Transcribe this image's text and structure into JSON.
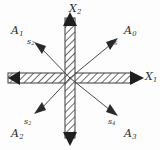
{
  "figure": {
    "background_color": "#fdfdfd",
    "ink_color": "#2b2b2b",
    "center": {
      "x": 70,
      "y": 78
    }
  },
  "axes": [
    {
      "name": "x1-axis",
      "label_base": "X",
      "label_sub": "1",
      "orientation": "horizontal",
      "style": "hatched-band",
      "arrow_ends": [
        "left",
        "right"
      ],
      "label_pos": {
        "x": 145,
        "y": 71
      }
    },
    {
      "name": "x2-axis",
      "label_base": "X",
      "label_sub": "2",
      "orientation": "vertical",
      "style": "hatched-band",
      "arrow_ends": [
        "top",
        "bottom"
      ],
      "label_pos": {
        "x": 69,
        "y": 3
      }
    }
  ],
  "rays": [
    {
      "name": "ray-s6",
      "label_base": "s",
      "label_sub": "6",
      "direction_deg": 45,
      "label_pos": {
        "x": 110,
        "y": 38
      }
    },
    {
      "name": "ray-s2-upper-left",
      "label_base": "s",
      "label_sub": "2",
      "direction_deg": 135,
      "label_pos": {
        "x": 27,
        "y": 38
      }
    },
    {
      "name": "ray-s2-lower-left",
      "label_base": "s",
      "label_sub": "2",
      "direction_deg": 225,
      "label_pos": {
        "x": 24,
        "y": 118
      }
    },
    {
      "name": "ray-s4",
      "label_base": "s",
      "label_sub": "4",
      "direction_deg": 315,
      "label_pos": {
        "x": 108,
        "y": 118
      }
    }
  ],
  "regions": [
    {
      "name": "region-a1",
      "label_base": "A",
      "label_sub": "1",
      "quadrant": "upper-left",
      "label_pos": {
        "x": 11,
        "y": 25
      }
    },
    {
      "name": "region-a0",
      "label_base": "A",
      "label_sub": "0",
      "quadrant": "upper-right",
      "label_pos": {
        "x": 124,
        "y": 25
      }
    },
    {
      "name": "region-a2",
      "label_base": "A",
      "label_sub": "2",
      "quadrant": "lower-left",
      "label_pos": {
        "x": 11,
        "y": 128
      }
    },
    {
      "name": "region-a3",
      "label_base": "A",
      "label_sub": "3",
      "quadrant": "lower-right",
      "label_pos": {
        "x": 124,
        "y": 128
      }
    }
  ]
}
